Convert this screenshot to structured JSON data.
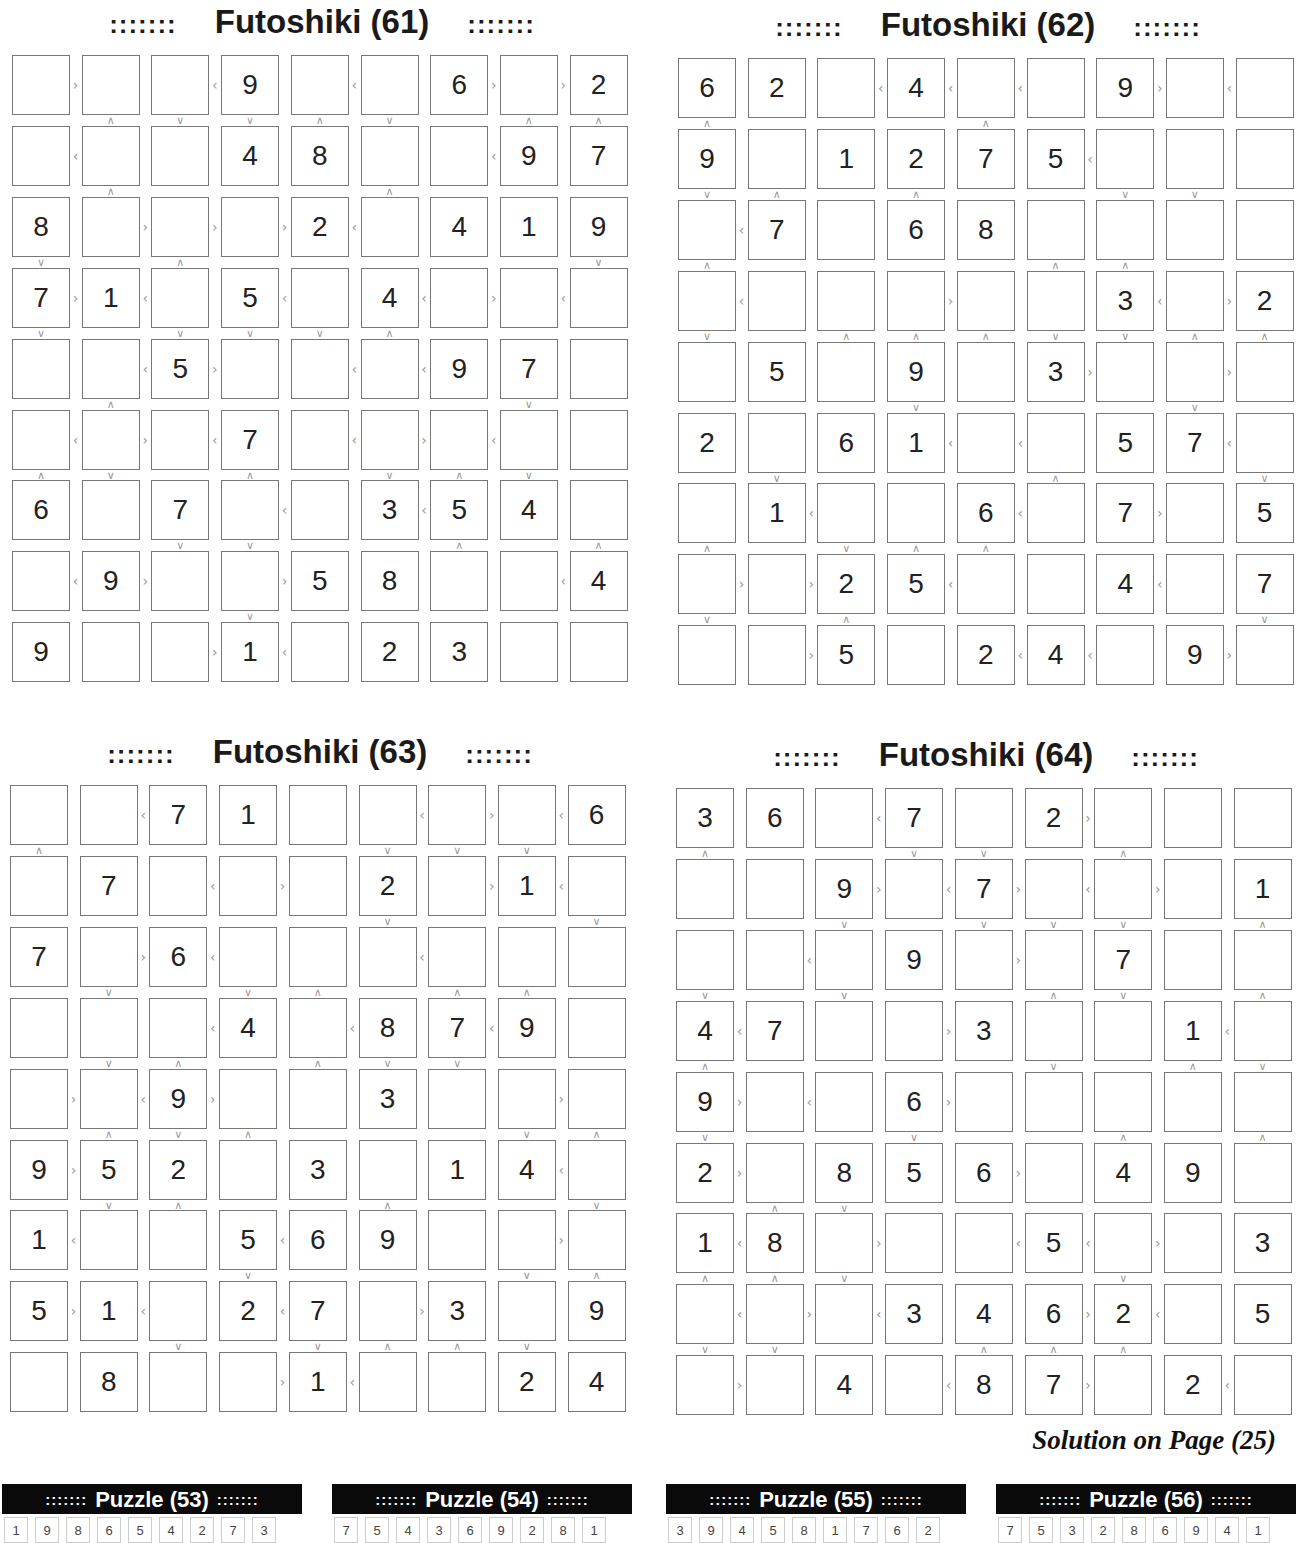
{
  "page": {
    "solution_note": "Solution on Page (25)"
  },
  "puzzles": [
    {
      "id": "61",
      "title": "Futoshiki (61)",
      "dots": ":::::::",
      "left": 12,
      "top": 3,
      "givens": [
        [
          "",
          "",
          "",
          "9",
          "",
          "",
          "6",
          "",
          "2"
        ],
        [
          "",
          "",
          "",
          "4",
          "8",
          "",
          "",
          "9",
          "7"
        ],
        [
          "8",
          "",
          "",
          "",
          "2",
          "",
          "4",
          "1",
          "9"
        ],
        [
          "7",
          "1",
          "",
          "5",
          "",
          "4",
          "",
          "",
          ""
        ],
        [
          "",
          "",
          "5",
          "",
          "",
          "",
          "9",
          "7",
          ""
        ],
        [
          "",
          "",
          "",
          "7",
          "",
          "",
          "",
          "",
          ""
        ],
        [
          "6",
          "",
          "7",
          "",
          "",
          "3",
          "5",
          "4",
          ""
        ],
        [
          "",
          "9",
          "",
          "",
          "5",
          "8",
          "",
          "",
          "4"
        ],
        [
          "9",
          "",
          "",
          "1",
          "",
          "2",
          "3",
          "",
          ""
        ]
      ],
      "hsigns": [
        [
          ">",
          "",
          "<",
          "",
          "<",
          "",
          ">",
          ">"
        ],
        [
          "<",
          "",
          "",
          "",
          "",
          "",
          "<",
          ""
        ],
        [
          "",
          ">",
          ">",
          ">",
          "<",
          "",
          "",
          ""
        ],
        [
          ">",
          "<",
          "",
          "<",
          "",
          "<",
          ">",
          "<"
        ],
        [
          "",
          "<",
          ">",
          "",
          "<",
          "<",
          "",
          ""
        ],
        [
          "<",
          ">",
          "<",
          "",
          "<",
          ">",
          "<",
          ""
        ],
        [
          "",
          "",
          "",
          "<",
          "",
          "<",
          "",
          ""
        ],
        [
          "<",
          ">",
          "",
          ">",
          "",
          "",
          "",
          "<"
        ],
        [
          "",
          "",
          ">",
          "<",
          "",
          "",
          "",
          ""
        ]
      ],
      "vsigns": [
        [
          "",
          "^",
          "v",
          "v",
          "^",
          "v",
          "",
          "^",
          "^"
        ],
        [
          "",
          "^",
          "",
          "",
          "",
          "^",
          "",
          "",
          ""
        ],
        [
          "v",
          "",
          "^",
          "",
          "",
          "",
          "",
          "",
          "v"
        ],
        [
          "v",
          "",
          "v",
          "v",
          "v",
          "^",
          "",
          "",
          ""
        ],
        [
          "",
          "^",
          "",
          "",
          "",
          "",
          "",
          "v",
          ""
        ],
        [
          "^",
          "v",
          "",
          "^",
          "",
          "v",
          "^",
          "v",
          ""
        ],
        [
          "",
          "",
          "v",
          "v",
          "",
          "",
          "^",
          "",
          "^"
        ],
        [
          "",
          "",
          "",
          "v",
          "",
          "",
          "",
          "",
          ""
        ]
      ]
    },
    {
      "id": "62",
      "title": "Futoshiki (62)",
      "dots": ":::::::",
      "left": 678,
      "top": 6,
      "givens": [
        [
          "6",
          "2",
          "",
          "4",
          "",
          "",
          "9",
          "",
          ""
        ],
        [
          "9",
          "",
          "1",
          "2",
          "7",
          "5",
          "",
          "",
          ""
        ],
        [
          "",
          "7",
          "",
          "6",
          "8",
          "",
          "",
          "",
          ""
        ],
        [
          "",
          "",
          "",
          "",
          "",
          "",
          "3",
          "",
          "2"
        ],
        [
          "",
          "5",
          "",
          "9",
          "",
          "3",
          "",
          "",
          ""
        ],
        [
          "2",
          "",
          "6",
          "1",
          "",
          "",
          "5",
          "7",
          ""
        ],
        [
          "",
          "1",
          "",
          "",
          "6",
          "",
          "7",
          "",
          "5"
        ],
        [
          "",
          "",
          "2",
          "5",
          "",
          "",
          "4",
          "",
          "7"
        ],
        [
          "",
          "",
          "5",
          "",
          "2",
          "4",
          "",
          "9",
          ""
        ]
      ],
      "hsigns": [
        [
          "",
          "",
          "<",
          "<",
          "<",
          "",
          ">",
          "<"
        ],
        [
          "",
          "",
          "",
          "",
          "",
          "<",
          "",
          ""
        ],
        [
          "<",
          "",
          "",
          "",
          "",
          "",
          "",
          ""
        ],
        [
          "<",
          "",
          "",
          ">",
          "",
          "",
          "<",
          ">"
        ],
        [
          "",
          "",
          "",
          "",
          "",
          ">",
          "",
          ">"
        ],
        [
          "",
          "",
          "",
          "<",
          "<",
          "",
          "",
          "<"
        ],
        [
          "",
          "<",
          "",
          "",
          "<",
          "",
          ">",
          ""
        ],
        [
          ">",
          ">",
          "",
          "<",
          "",
          "",
          "<",
          ""
        ],
        [
          "",
          ">",
          "",
          "",
          "<",
          "<",
          "",
          ">"
        ]
      ],
      "vsigns": [
        [
          "^",
          "",
          "",
          "",
          "^",
          "",
          "",
          "",
          ""
        ],
        [
          "v",
          "^",
          "",
          "^",
          "",
          "",
          "v",
          "v",
          ""
        ],
        [
          "^",
          "",
          "",
          "",
          "",
          "^",
          "^",
          "",
          ""
        ],
        [
          "v",
          "",
          "^",
          "^",
          "^",
          "v",
          "v",
          "^",
          "^"
        ],
        [
          "",
          "",
          "",
          "v",
          "",
          "",
          "",
          "v",
          ""
        ],
        [
          "",
          "v",
          "",
          "",
          "",
          "^",
          "",
          "",
          "v"
        ],
        [
          "^",
          "",
          "v",
          "^",
          "^",
          "",
          "",
          "",
          ""
        ],
        [
          "v",
          "",
          "^",
          "",
          "",
          "",
          "",
          "",
          "v"
        ]
      ]
    },
    {
      "id": "63",
      "title": "Futoshiki (63)",
      "dots": ":::::::",
      "left": 10,
      "top": 733,
      "givens": [
        [
          "",
          "",
          "7",
          "1",
          "",
          "",
          "",
          "",
          "6"
        ],
        [
          "",
          "7",
          "",
          "",
          "",
          "2",
          "",
          "1",
          ""
        ],
        [
          "7",
          "",
          "6",
          "",
          "",
          "",
          "",
          "",
          ""
        ],
        [
          "",
          "",
          "",
          "4",
          "",
          "8",
          "7",
          "9",
          ""
        ],
        [
          "",
          "",
          "9",
          "",
          "",
          "3",
          "",
          "",
          ""
        ],
        [
          "9",
          "5",
          "2",
          "",
          "3",
          "",
          "1",
          "4",
          ""
        ],
        [
          "1",
          "",
          "",
          "5",
          "6",
          "9",
          "",
          "",
          ""
        ],
        [
          "5",
          "1",
          "",
          "2",
          "7",
          "",
          "3",
          "",
          "9"
        ],
        [
          "",
          "8",
          "",
          "",
          "1",
          "",
          "",
          "2",
          "4"
        ]
      ],
      "hsigns": [
        [
          "",
          "<",
          "",
          "",
          "",
          "<",
          ">",
          "<"
        ],
        [
          "",
          "",
          "<",
          ">",
          "",
          "",
          ">",
          "<"
        ],
        [
          "",
          ">",
          "<",
          "",
          "",
          "<",
          "",
          ""
        ],
        [
          "",
          "",
          "<",
          "",
          "<",
          "",
          "<",
          ""
        ],
        [
          ">",
          "<",
          ">",
          "",
          "",
          "",
          "",
          ">"
        ],
        [
          ">",
          "",
          "",
          "",
          "",
          "",
          "",
          "<"
        ],
        [
          "<",
          "",
          "",
          "<",
          "",
          "",
          "",
          ">"
        ],
        [
          ">",
          "<",
          "",
          "<",
          "",
          ">",
          "",
          ""
        ],
        [
          "",
          "",
          "",
          ">",
          "<",
          "",
          "",
          ""
        ]
      ],
      "vsigns": [
        [
          "^",
          "",
          "",
          "",
          "",
          "v",
          "v",
          "v",
          ""
        ],
        [
          "",
          "",
          "",
          "",
          "",
          "v",
          "",
          "",
          "v"
        ],
        [
          "",
          "v",
          "",
          "v",
          "^",
          "",
          "^",
          "^",
          ""
        ],
        [
          "",
          "v",
          "^",
          "",
          "^",
          "v",
          "v",
          "",
          ""
        ],
        [
          "",
          "^",
          "v",
          "^",
          "",
          "",
          "",
          "v",
          "^"
        ],
        [
          "",
          "v",
          "^",
          "",
          "",
          "^",
          "",
          "",
          "v"
        ],
        [
          "",
          "",
          "",
          "v",
          "",
          "",
          "",
          "v",
          "^"
        ],
        [
          "",
          "",
          "v",
          "",
          "v",
          "^",
          "^",
          "v",
          ""
        ]
      ]
    },
    {
      "id": "64",
      "title": "Futoshiki (64)",
      "dots": ":::::::",
      "left": 676,
      "top": 736,
      "givens": [
        [
          "3",
          "6",
          "",
          "7",
          "",
          "2",
          "",
          "",
          ""
        ],
        [
          "",
          "",
          "9",
          "",
          "7",
          "",
          "",
          "",
          "1"
        ],
        [
          "",
          "",
          "",
          "9",
          "",
          "",
          "7",
          "",
          ""
        ],
        [
          "4",
          "7",
          "",
          "",
          "3",
          "",
          "",
          "1",
          ""
        ],
        [
          "9",
          "",
          "",
          "6",
          "",
          "",
          "",
          "",
          ""
        ],
        [
          "2",
          "",
          "8",
          "5",
          "6",
          "",
          "4",
          "9",
          ""
        ],
        [
          "1",
          "8",
          "",
          "",
          "",
          "5",
          "",
          "",
          "3"
        ],
        [
          "",
          "",
          "",
          "3",
          "4",
          "6",
          "2",
          "",
          "5"
        ],
        [
          "",
          "",
          "4",
          "",
          "8",
          "7",
          "",
          "2",
          ""
        ]
      ],
      "hsigns": [
        [
          "",
          "",
          "<",
          "",
          "",
          ">",
          "",
          ""
        ],
        [
          "",
          "",
          ">",
          "<",
          ">",
          "<",
          ">",
          ""
        ],
        [
          "",
          "<",
          "",
          "",
          ">",
          "",
          "",
          ""
        ],
        [
          "<",
          "",
          "",
          ">",
          "",
          "",
          "",
          "<"
        ],
        [
          ">",
          "<",
          "",
          ">",
          "",
          "",
          "",
          ""
        ],
        [
          ">",
          "",
          "",
          "",
          ">",
          "",
          "",
          ""
        ],
        [
          "<",
          "",
          ">",
          "",
          "<",
          "<",
          ">",
          ""
        ],
        [
          "<",
          ">",
          "<",
          "",
          "",
          ">",
          "<",
          ""
        ],
        [
          ">",
          "",
          "",
          "<",
          "",
          ">",
          "",
          "<"
        ]
      ],
      "vsigns": [
        [
          "^",
          "",
          "",
          "v",
          "v",
          "",
          "^",
          "",
          ""
        ],
        [
          "",
          "",
          "v",
          "",
          "v",
          "v",
          "v",
          "",
          "^"
        ],
        [
          "v",
          "",
          "v",
          "",
          "",
          "^",
          "v",
          "",
          "^"
        ],
        [
          "^",
          "",
          "",
          "",
          "",
          "v",
          "",
          "^",
          "v"
        ],
        [
          "v",
          "",
          "",
          "v",
          "",
          "",
          "^",
          "",
          "^"
        ],
        [
          "",
          "^",
          "v",
          "",
          "",
          "",
          "",
          "",
          ""
        ],
        [
          "^",
          "^",
          "v",
          "",
          "",
          "",
          "v",
          "",
          ""
        ],
        [
          "v",
          "v",
          "",
          "",
          "^",
          "^",
          "^",
          "",
          ""
        ]
      ]
    }
  ],
  "solution_strips": [
    {
      "title": "Puzzle (53)",
      "dots": ":::::::",
      "left": 2,
      "values": [
        "1",
        "9",
        "8",
        "6",
        "5",
        "4",
        "2",
        "7",
        "3"
      ]
    },
    {
      "title": "Puzzle (54)",
      "dots": ":::::::",
      "left": 332,
      "values": [
        "7",
        "5",
        "4",
        "3",
        "6",
        "9",
        "2",
        "8",
        "1"
      ]
    },
    {
      "title": "Puzzle (55)",
      "dots": ":::::::",
      "left": 666,
      "values": [
        "3",
        "9",
        "4",
        "5",
        "8",
        "1",
        "7",
        "6",
        "2"
      ]
    },
    {
      "title": "Puzzle (56)",
      "dots": ":::::::",
      "left": 996,
      "values": [
        "7",
        "5",
        "3",
        "2",
        "8",
        "6",
        "9",
        "4",
        "1"
      ]
    }
  ]
}
